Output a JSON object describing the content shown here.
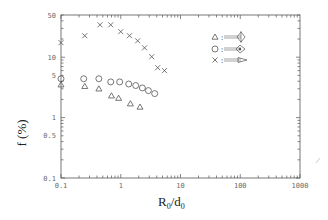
{
  "chart_data": {
    "type": "scatter",
    "title": "",
    "xlabel": "R0/d0",
    "ylabel": "f (%)",
    "xscale": "log",
    "yscale": "log",
    "xlim": [
      0.1,
      1000
    ],
    "ylim": [
      0.1,
      50
    ],
    "x_tick_labels": [
      "0.1",
      "1",
      "10",
      "100",
      "1000"
    ],
    "y_tick_labels": [
      "50",
      "10",
      "5",
      "1",
      "0.5",
      "0.1"
    ],
    "grid": false,
    "legend_position": "upper-right-inside",
    "legend": [
      {
        "marker": "triangle",
        "label": "fin-shaped nozzle type 1 (drawn glyph)"
      },
      {
        "marker": "circle",
        "label": "fin-shaped nozzle type 2 (drawn glyph)"
      },
      {
        "marker": "x",
        "label": "fin-shaped nozzle type 3 (drawn glyph)"
      }
    ],
    "series": [
      {
        "name": "triangle",
        "marker": "triangle",
        "x": [
          0.1,
          0.25,
          0.43,
          0.7,
          0.92,
          1.45,
          2.1
        ],
        "y": [
          3.5,
          3.3,
          3.0,
          2.3,
          2.1,
          1.7,
          1.5
        ]
      },
      {
        "name": "circle",
        "marker": "circle",
        "x": [
          0.1,
          0.24,
          0.43,
          0.68,
          0.96,
          1.36,
          1.78,
          2.3,
          2.9,
          3.7
        ],
        "y": [
          4.4,
          4.4,
          4.4,
          3.9,
          3.9,
          3.6,
          3.4,
          3.1,
          2.8,
          2.5
        ]
      },
      {
        "name": "x",
        "marker": "x",
        "x": [
          0.1,
          0.25,
          0.45,
          0.68,
          1.0,
          1.4,
          1.92,
          2.5,
          3.3,
          4.15,
          5.4
        ],
        "y": [
          17.4,
          22.7,
          34.4,
          34.4,
          26.5,
          22.7,
          18.7,
          14.3,
          10.2,
          6.7,
          6.0
        ]
      }
    ]
  },
  "labels": {
    "xlabel_main": "R",
    "xlabel_sub0": "0",
    "xlabel_slash": "/d",
    "xlabel_sub1": "0",
    "ylabel": "f (%)",
    "legend_sep": ":"
  }
}
